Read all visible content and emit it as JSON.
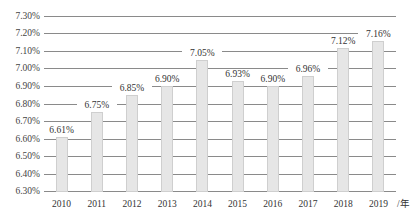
{
  "chart_data": {
    "type": "bar",
    "title": "",
    "xlabel": "年",
    "ylabel": "",
    "categories": [
      "2010",
      "2011",
      "2012",
      "2013",
      "2014",
      "2015",
      "2016",
      "2017",
      "2018",
      "2019"
    ],
    "values": [
      6.61,
      6.75,
      6.85,
      6.9,
      7.05,
      6.93,
      6.9,
      6.96,
      7.12,
      7.16
    ],
    "value_labels": [
      "6.61%",
      "6.75%",
      "6.85%",
      "6.90%",
      "7.05%",
      "6.93%",
      "6.90%",
      "6.96%",
      "7.12%",
      "7.16%"
    ],
    "ylim": [
      6.3,
      7.3
    ],
    "yticks": [
      "6.30%",
      "6.40%",
      "6.50%",
      "6.60%",
      "6.70%",
      "6.80%",
      "6.90%",
      "7.00%",
      "7.10%",
      "7.20%",
      "7.30%"
    ],
    "grid": true,
    "legend": "none",
    "x_unit_label": "/年",
    "colors": {
      "bar_fill": "#e6e6e6",
      "bar_border": "#cfcfcf",
      "grid": "#8a8a8a"
    }
  }
}
